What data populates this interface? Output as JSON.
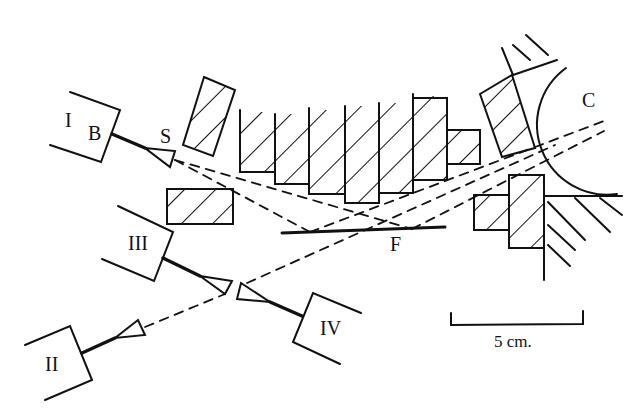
{
  "diagram": {
    "labels": {
      "detector_1": "I",
      "detector_2": "II",
      "detector_3": "III",
      "detector_4": "IV",
      "b_label": "B",
      "source_label": "S",
      "foil_label": "F",
      "target_label": "C"
    },
    "scale_bar": {
      "label": "5 cm."
    },
    "colors": {
      "ink": "#111111",
      "background": "#ffffff"
    }
  }
}
